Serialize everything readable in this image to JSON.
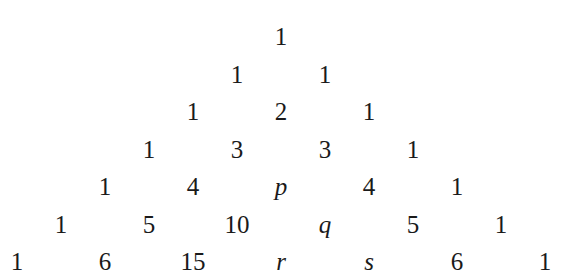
{
  "rows": [
    [
      "1"
    ],
    [
      "1",
      "1"
    ],
    [
      "1",
      "2",
      "1"
    ],
    [
      "1",
      "3",
      "3",
      "1"
    ],
    [
      "1",
      "4",
      "p",
      "4",
      "1"
    ],
    [
      "1",
      "5",
      "10",
      "q",
      "5",
      "1"
    ],
    [
      "1",
      "6",
      "15",
      "r",
      "s",
      "6",
      "1"
    ]
  ],
  "variables": [
    "p",
    "q",
    "r",
    "s"
  ],
  "layout": {
    "center_x": 281,
    "first_row_top": 22,
    "row_spacing": 37.5,
    "col_spacing": 88
  }
}
